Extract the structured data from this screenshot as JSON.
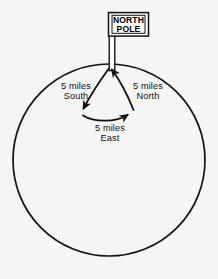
{
  "diagram": {
    "background_color": "#f6f5f3",
    "stroke_color": "#111111",
    "flag": {
      "label_line1": "NORTH",
      "label_line2": "POLE",
      "fill_color": "#ffffff",
      "border_color": "#111111"
    },
    "earth": {
      "name": "earth-circle",
      "center_x": 109,
      "center_y": 160,
      "radius": 96
    },
    "legs": [
      {
        "id": "south",
        "line1": "5 miles",
        "line2": "South",
        "direction": "south",
        "distance": "5 miles"
      },
      {
        "id": "east",
        "line1": "5 miles",
        "line2": "East",
        "direction": "east",
        "distance": "5 miles"
      },
      {
        "id": "north",
        "line1": "5 miles",
        "line2": "North",
        "direction": "north",
        "distance": "5 miles"
      }
    ]
  }
}
